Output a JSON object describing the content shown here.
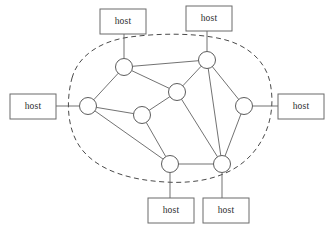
{
  "diagram": {
    "colors": {
      "box_stroke": "#6b6b6b",
      "node_stroke": "#4a4a4a",
      "link_stroke": "#585858",
      "cloud_stroke": "#4a4a4a",
      "background": "#ffffff",
      "text": "#2b2b2b"
    },
    "hosts": [
      {
        "id": "host-top-left",
        "label": "host",
        "x": 100,
        "y": 9,
        "w": 46,
        "h": 25
      },
      {
        "id": "host-top-right",
        "label": "host",
        "x": 186,
        "y": 6,
        "w": 46,
        "h": 25
      },
      {
        "id": "host-left",
        "label": "host",
        "x": 10,
        "y": 94,
        "w": 46,
        "h": 25
      },
      {
        "id": "host-right",
        "label": "host",
        "x": 278,
        "y": 94,
        "w": 46,
        "h": 25
      },
      {
        "id": "host-bottom-left",
        "label": "host",
        "x": 148,
        "y": 198,
        "w": 46,
        "h": 25
      },
      {
        "id": "host-bottom-right",
        "label": "host",
        "x": 203,
        "y": 198,
        "w": 46,
        "h": 25
      }
    ],
    "routers": [
      {
        "id": "r-left",
        "name": "router-left",
        "cx": 88,
        "cy": 106,
        "r": 8.5
      },
      {
        "id": "r-top-left",
        "name": "router-top-left",
        "cx": 124,
        "cy": 67,
        "r": 8.5
      },
      {
        "id": "r-top-right",
        "name": "router-top-right",
        "cx": 207,
        "cy": 60,
        "r": 8.5
      },
      {
        "id": "r-center",
        "name": "router-center",
        "cx": 177,
        "cy": 92,
        "r": 8.5
      },
      {
        "id": "r-center-left",
        "name": "router-center-left",
        "cx": 142,
        "cy": 115,
        "r": 8.5
      },
      {
        "id": "r-right",
        "name": "router-right",
        "cx": 244,
        "cy": 106,
        "r": 8.5
      },
      {
        "id": "r-bottom-left",
        "name": "router-bottom-left",
        "cx": 170,
        "cy": 164,
        "r": 8.5
      },
      {
        "id": "r-bottom-right",
        "name": "router-bottom-right",
        "cx": 222,
        "cy": 164,
        "r": 8.5
      }
    ],
    "links": [
      {
        "from": "r-top-left",
        "to": "r-top-right"
      },
      {
        "from": "r-top-left",
        "to": "r-left"
      },
      {
        "from": "r-top-left",
        "to": "r-center"
      },
      {
        "from": "r-left",
        "to": "r-center-left"
      },
      {
        "from": "r-left",
        "to": "r-bottom-left"
      },
      {
        "from": "r-center-left",
        "to": "r-center"
      },
      {
        "from": "r-center-left",
        "to": "r-bottom-left"
      },
      {
        "from": "r-center",
        "to": "r-top-right"
      },
      {
        "from": "r-center",
        "to": "r-bottom-right"
      },
      {
        "from": "r-top-right",
        "to": "r-right"
      },
      {
        "from": "r-top-right",
        "to": "r-bottom-right"
      },
      {
        "from": "r-right",
        "to": "r-bottom-right"
      },
      {
        "from": "r-bottom-left",
        "to": "r-bottom-right"
      }
    ],
    "access_links": [
      {
        "host": "host-top-left",
        "router": "r-top-left",
        "x1": 124,
        "y1": 34,
        "x2": 124,
        "y2": 58
      },
      {
        "host": "host-top-right",
        "router": "r-top-right",
        "x1": 207,
        "y1": 31,
        "x2": 207,
        "y2": 51
      },
      {
        "host": "host-left",
        "router": "r-left",
        "x1": 56,
        "y1": 106,
        "x2": 79,
        "y2": 106
      },
      {
        "host": "host-right",
        "router": "r-right",
        "x1": 253,
        "y1": 106,
        "x2": 278,
        "y2": 106
      },
      {
        "host": "host-bottom-left",
        "router": "r-bottom-left",
        "x1": 170,
        "y1": 173,
        "x2": 170,
        "y2": 198
      },
      {
        "host": "host-bottom-right",
        "router": "r-bottom-right",
        "x1": 222,
        "y1": 173,
        "x2": 222,
        "y2": 198
      }
    ],
    "cloud": {
      "name": "network-cloud",
      "path": "M 72 78 C 78 56, 100 41, 130 37 C 160 33, 196 33, 222 39 C 248 45, 268 62, 271 88 C 275 115, 266 142, 246 160 C 226 178, 196 184, 165 182 C 132 180, 102 172, 84 152 C 66 132, 66 100, 72 78 Z",
      "dash": "5 3.5"
    }
  }
}
